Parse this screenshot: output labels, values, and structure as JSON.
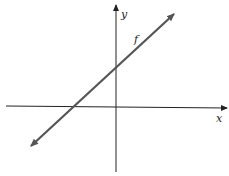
{
  "diagram": {
    "type": "linear-function-graph",
    "axes": {
      "x_label": "x",
      "y_label": "y"
    },
    "function_label": "f",
    "line": {
      "slope_sign": "positive",
      "y_intercept_sign": "positive",
      "x_intercept_sign": "negative",
      "arrows": "both-ends"
    },
    "colors": {
      "axis": "#222222",
      "line": "#555555",
      "text": "#222222"
    }
  }
}
